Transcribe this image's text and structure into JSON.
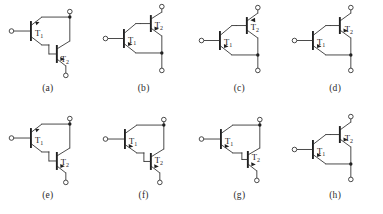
{
  "figure": {
    "rows": 2,
    "columns": 4,
    "background_color": "#ffffff",
    "line_color": "#2b2b2b",
    "label_color": "#232323"
  },
  "labels": {
    "t1": "T",
    "t1_sub": "1",
    "t2": "T",
    "t2_sub": "2"
  },
  "cells": [
    {
      "id": "a",
      "caption": "(a)",
      "layout": "t2-lower-right",
      "t1_label": "T",
      "t1_sub": "1",
      "t2_label": "T",
      "t2_sub": "2",
      "t1_type": "npn",
      "t2_type": "npn",
      "terminals": [
        "left-base",
        "top-right-collector",
        "bottom-right-emitter"
      ],
      "junction_dots": 1
    },
    {
      "id": "b",
      "caption": "(b)",
      "layout": "t2-upper-right",
      "t1_label": "T",
      "t1_sub": "1",
      "t2_label": "T",
      "t2_sub": "2",
      "t1_type": "pnp",
      "t2_type": "npn",
      "terminals": [
        "left-base",
        "top-right-collector",
        "bottom-right-emitter"
      ],
      "junction_dots": 1
    },
    {
      "id": "c",
      "caption": "(c)",
      "layout": "t2-upper-right",
      "t1_label": "T",
      "t1_sub": "1",
      "t2_label": "T",
      "t2_sub": "2",
      "t1_type": "pnp",
      "t2_type": "npn",
      "terminals": [
        "left-base",
        "top-right-collector",
        "bottom-right-emitter"
      ],
      "junction_dots": 1
    },
    {
      "id": "d",
      "caption": "(d)",
      "layout": "t2-upper-right",
      "t1_label": "T",
      "t1_sub": "1",
      "t2_label": "T",
      "t2_sub": "2",
      "t1_type": "pnp",
      "t2_type": "pnp",
      "terminals": [
        "left-base",
        "top-right-collector",
        "bottom-right-emitter"
      ],
      "junction_dots": 1
    },
    {
      "id": "e",
      "caption": "(e)",
      "layout": "t2-lower-right",
      "t1_label": "T",
      "t1_sub": "1",
      "t2_label": "T",
      "t2_sub": "2",
      "t1_type": "pnp",
      "t2_type": "npn",
      "terminals": [
        "left-base",
        "top-right-collector",
        "bottom-right-emitter"
      ],
      "junction_dots": 1
    },
    {
      "id": "f",
      "caption": "(f)",
      "layout": "t2-lower-right",
      "t1_label": "T",
      "t1_sub": "1",
      "t2_label": "T",
      "t2_sub": "2",
      "t1_type": "npn",
      "t2_type": "npn",
      "terminals": [
        "left-base",
        "top-right-collector",
        "bottom-right-emitter"
      ],
      "junction_dots": 1
    },
    {
      "id": "g",
      "caption": "(g)",
      "layout": "t2-lower-right",
      "t1_label": "T",
      "t1_sub": "1",
      "t2_label": "T",
      "t2_sub": "2",
      "t1_type": "npn",
      "t2_type": "npn",
      "terminals": [
        "left-base",
        "top-right-collector",
        "bottom-right-emitter"
      ],
      "junction_dots": 1
    },
    {
      "id": "h",
      "caption": "(h)",
      "layout": "t2-upper-right",
      "t1_label": "T",
      "t1_sub": "1",
      "t2_label": "T",
      "t2_sub": "2",
      "t1_type": "pnp",
      "t2_type": "pnp",
      "terminals": [
        "left-base",
        "top-right-collector",
        "bottom-right-emitter"
      ],
      "junction_dots": 1
    }
  ]
}
